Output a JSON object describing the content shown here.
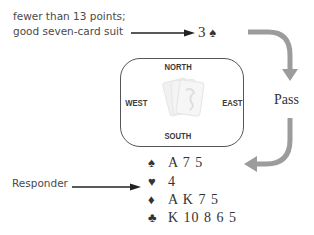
{
  "annotations": {
    "opener_note_line1": "fewer than 13 points;",
    "opener_note_line2": "good seven-card suit",
    "responder_label": "Responder"
  },
  "bid": {
    "level": "3",
    "suit_symbol": "♠",
    "suit_name": "spades"
  },
  "table": {
    "north": "NORTH",
    "south": "SOUTH",
    "west": "WEST",
    "east": "EAST",
    "center_icon": "playing-cards-icon"
  },
  "east_action": "Pass",
  "responder_hand": [
    {
      "suit": "♠",
      "suit_name": "spades",
      "cards": "A 7 5"
    },
    {
      "suit": "♥",
      "suit_name": "hearts",
      "cards": "4"
    },
    {
      "suit": "♦",
      "suit_name": "diamonds",
      "cards": "A K 7 5"
    },
    {
      "suit": "♣",
      "suit_name": "clubs",
      "cards": "K 10 8 6 5"
    }
  ],
  "colors": {
    "text": "#333333",
    "flow_arrow": "#9a9a9a",
    "pointer_arrow": "#222222",
    "table_border": "#555555"
  }
}
